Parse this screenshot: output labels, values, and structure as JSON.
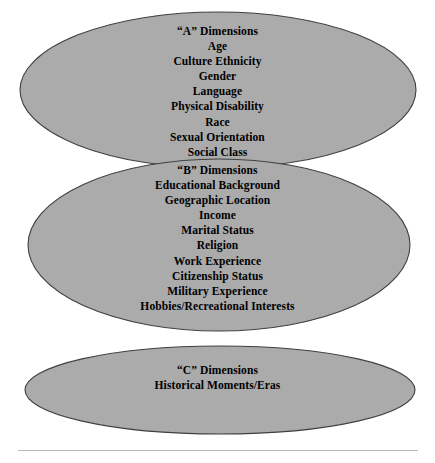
{
  "figure": {
    "colors": {
      "ellipse_fill": "#ababab",
      "ellipse_stroke": "#404040",
      "text": "#000000",
      "background": "#ffffff",
      "rule": "#b9b9b9"
    }
  },
  "ellipses": [
    {
      "id": "ellipse-a",
      "heading": "“A” Dimensions",
      "items": [
        "Age",
        "Culture Ethnicity",
        "Gender",
        "Language",
        "Physical Disability",
        "Race",
        "Sexual Orientation",
        "Social Class"
      ]
    },
    {
      "id": "ellipse-b",
      "heading": "“B” Dimensions",
      "items": [
        "Educational Background",
        "Geographic Location",
        "Income",
        "Marital Status",
        "Religion",
        "Work Experience",
        "Citizenship Status",
        "Military Experience",
        "Hobbies/Recreational Interests"
      ]
    },
    {
      "id": "ellipse-c",
      "heading": "“C” Dimensions",
      "items": [
        "Historical Moments/Eras"
      ]
    }
  ]
}
